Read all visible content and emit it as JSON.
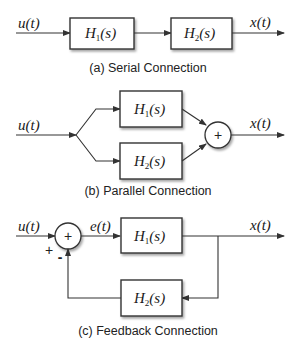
{
  "diagrams": {
    "serial": {
      "caption": "(a) Serial Connection",
      "input": "u(t)",
      "output": "x(t)",
      "blocks": [
        {
          "name": "H",
          "sub": "1",
          "arg": "(s)"
        },
        {
          "name": "H",
          "sub": "2",
          "arg": "(s)"
        }
      ]
    },
    "parallel": {
      "caption": "(b) Parallel Connection",
      "input": "u(t)",
      "output": "x(t)",
      "sum_symbol": "+",
      "blocks": [
        {
          "name": "H",
          "sub": "1",
          "arg": "(s)"
        },
        {
          "name": "H",
          "sub": "2",
          "arg": "(s)"
        }
      ]
    },
    "feedback": {
      "caption": "(c) Feedback Connection",
      "input": "u(t)",
      "error": "e(t)",
      "output": "x(t)",
      "sum_symbol": "+",
      "plus_sign": "+",
      "minus_sign": "-",
      "blocks": [
        {
          "name": "H",
          "sub": "1",
          "arg": "(s)"
        },
        {
          "name": "H",
          "sub": "2",
          "arg": "(s)"
        }
      ]
    }
  }
}
